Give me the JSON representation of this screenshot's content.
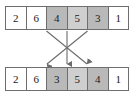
{
  "figure": {
    "background_color": "#ffffff",
    "border_color": "#6e6e6e",
    "text_color": "#1a1a1a",
    "arrow_color": "#6b6b6b",
    "shade_dark": "#b9b9b9",
    "shade_light": "#cfcfcf"
  },
  "top_row": {
    "label": "before",
    "cells": [
      {
        "value": "2",
        "shade": "none"
      },
      {
        "value": "6",
        "shade": "none"
      },
      {
        "value": "4",
        "shade": "dark"
      },
      {
        "value": "5",
        "shade": "light"
      },
      {
        "value": "3",
        "shade": "dark"
      },
      {
        "value": "1",
        "shade": "none"
      }
    ]
  },
  "bottom_row": {
    "label": "after",
    "cells": [
      {
        "value": "2",
        "shade": "none"
      },
      {
        "value": "6",
        "shade": "none"
      },
      {
        "value": "3",
        "shade": "dark"
      },
      {
        "value": "5",
        "shade": "light"
      },
      {
        "value": "4",
        "shade": "dark"
      },
      {
        "value": "1",
        "shade": "none"
      }
    ]
  },
  "arrows": [
    {
      "name": "arrow-index2-to-index4",
      "from_index": 2,
      "to_index": 4
    },
    {
      "name": "arrow-index3-to-index3",
      "from_index": 3,
      "to_index": 3
    },
    {
      "name": "arrow-index4-to-index2",
      "from_index": 4,
      "to_index": 2
    }
  ]
}
